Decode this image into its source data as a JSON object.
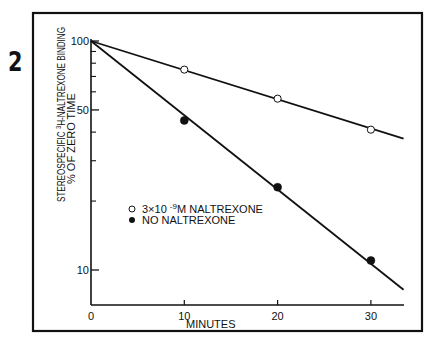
{
  "figure": {
    "number": "2",
    "frame_color": "#111111",
    "background": "#ffffff"
  },
  "chart_data": {
    "type": "line",
    "title": "",
    "xlabel": "MINUTES",
    "ylabel_lines": [
      "STEREOSPECIFIC ³H-NALTREXONE BINDING",
      "% OF ZERO TIME"
    ],
    "ylabel_line1_pre": "STEREOSPECIFIC ",
    "ylabel_line1_sup": "3",
    "ylabel_line1_post": "H-NALTREXONE  BINDING",
    "ylabel_line2": "% OF ZERO TIME",
    "x_ticks": [
      0,
      10,
      20,
      30
    ],
    "x_tick_labels": [
      "0",
      "10",
      "20",
      "30"
    ],
    "xlim": [
      0,
      34
    ],
    "y_scale": "log",
    "ylim": [
      7,
      100
    ],
    "y_major_ticks": [
      100,
      50,
      10
    ],
    "y_major_labels": [
      "100",
      "50",
      "10"
    ],
    "y_minor_ticks": [
      90,
      80,
      70,
      60,
      40,
      30,
      20
    ],
    "grid": false,
    "legend_position": "inside-left-middle",
    "series": [
      {
        "name": "3×10⁻⁹M NALTREXONE",
        "legend_label_pre": "3×10 ",
        "legend_label_sup": "-9",
        "legend_label_post": "M  NALTREXONE",
        "marker": "open-circle",
        "x": [
          0,
          10,
          20,
          30
        ],
        "values": [
          100,
          75,
          56,
          41
        ],
        "fit_line": {
          "x0": 0,
          "y0": 100,
          "x1": 33.5,
          "y1": 37.5
        }
      },
      {
        "name": "NO NALTREXONE",
        "legend_label_pre": "NO  NALTREXONE",
        "marker": "filled-circle",
        "x": [
          0,
          10,
          20,
          30
        ],
        "values": [
          100,
          45,
          23,
          11
        ],
        "fit_line": {
          "x0": 0,
          "y0": 100,
          "x1": 33.5,
          "y1": 8.2
        }
      }
    ]
  }
}
